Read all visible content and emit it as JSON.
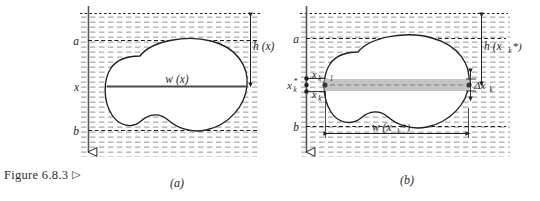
{
  "figure": {
    "caption_text": "Figure 6.8.3",
    "caption_marker": "▷",
    "panels": [
      {
        "id": "a",
        "label": "(a)",
        "axis_labels": [
          "a",
          "x",
          "b"
        ],
        "width_label": "w (x)",
        "depth_label": "h (x)",
        "surface_label": "",
        "region": "submerged-plate"
      },
      {
        "id": "b",
        "label": "(b)",
        "axis_labels": [
          "a",
          "b"
        ],
        "sample_point_label": "xₖ*",
        "partition_upper_label": "xₖ₋₁",
        "partition_lower_label": "xₖ",
        "width_label": "w (xₖ*)",
        "depth_label": "h (xₖ*)",
        "thickness_label": "Δxₖ",
        "region": "submerged-plate-with-strip"
      }
    ]
  },
  "colors": {
    "ink": "#1f1f1f",
    "hatch": "#8d8d8d",
    "strip_fill": "#bfbfbf",
    "plate_fill": "#ffffff",
    "paper": "#ffffff"
  },
  "panel_a": {
    "axis_label_a": "a",
    "axis_label_x": "x",
    "axis_label_b": "b",
    "w_label": "w (x)",
    "h_label": "h (x)",
    "bottom_label": "(a)"
  },
  "panel_b": {
    "axis_label_a": "a",
    "axis_label_b": "b",
    "xk_star": "x",
    "xk_star_sub": "k",
    "xk_star_sup": "*",
    "xk_minus_1": "x",
    "xk_minus_1_sub": "k − 1",
    "xk": "x",
    "xk_sub": "k",
    "w_label": "w (x",
    "w_label_sub": "k",
    "w_label_tail": "*)",
    "h_label": "h (x",
    "h_label_sub": "k",
    "h_label_tail": "*)",
    "delta_label": "Δx",
    "delta_label_sub": "k",
    "bottom_label": "(b)"
  }
}
